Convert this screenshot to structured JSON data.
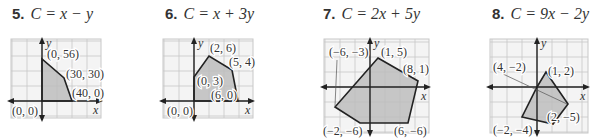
{
  "problems": [
    {
      "number": "5.",
      "objective": "C = x − y",
      "title_x": 12,
      "grid": {
        "x": 11,
        "y": 39,
        "w": 90,
        "h": 79,
        "cell": 15
      },
      "origin_px": [
        42,
        101
      ],
      "axis_labels": {
        "x": "x",
        "y": "y"
      },
      "vertices": [
        {
          "label": "(0, 0)",
          "coord": [
            0,
            0
          ],
          "px": [
            42,
            101
          ],
          "label_px": [
            12,
            115
          ]
        },
        {
          "label": "(0, 56)",
          "coord": [
            0,
            56
          ],
          "px": [
            42,
            59
          ],
          "label_px": [
            47,
            58
          ]
        },
        {
          "label": "(30, 30)",
          "coord": [
            30,
            30
          ],
          "px": [
            64,
            78
          ],
          "label_px": [
            66,
            78
          ]
        },
        {
          "label": "(40, 0)",
          "coord": [
            40,
            0
          ],
          "px": [
            72,
            101
          ],
          "label_px": [
            72,
            97
          ]
        }
      ]
    },
    {
      "number": "6.",
      "objective": "C = x + 3y",
      "title_x": 165,
      "grid": {
        "x": 163,
        "y": 39,
        "w": 90,
        "h": 79,
        "cell": 15
      },
      "origin_px": [
        194,
        101
      ],
      "axis_labels": {
        "x": "x",
        "y": "y"
      },
      "vertices": [
        {
          "label": "(0, 0)",
          "coord": [
            0,
            0
          ],
          "px": [
            194,
            101
          ],
          "label_px": [
            167,
            115
          ]
        },
        {
          "label": "(0, 3)",
          "coord": [
            0,
            3
          ],
          "px": [
            194,
            77
          ],
          "label_px": [
            197,
            85
          ]
        },
        {
          "label": "(2, 6)",
          "coord": [
            2,
            6
          ],
          "px": [
            209,
            56
          ],
          "label_px": [
            210,
            52
          ]
        },
        {
          "label": "(5, 4)",
          "coord": [
            5,
            4
          ],
          "px": [
            232,
            70
          ],
          "label_px": [
            229,
            66
          ]
        },
        {
          "label": "(6, 0)",
          "coord": [
            6,
            0
          ],
          "px": [
            238,
            101
          ],
          "label_px": [
            211,
            99
          ]
        }
      ]
    },
    {
      "number": "7.",
      "objective": "C = 2x + 5y",
      "title_x": 323,
      "grid": {
        "x": 324,
        "y": 39,
        "w": 105,
        "h": 94,
        "cell": 15
      },
      "origin_px": [
        370,
        87
      ],
      "axis_labels": {
        "x": "x",
        "y": "y"
      },
      "vertices": [
        {
          "label": "(1, 5)",
          "coord": [
            1,
            5
          ],
          "px": [
            378,
            58
          ],
          "label_px": [
            381,
            56
          ]
        },
        {
          "label": "(8, 1)",
          "coord": [
            8,
            1
          ],
          "px": [
            418,
            81
          ],
          "label_px": [
            403,
            73
          ]
        },
        {
          "label": "(6, −6)",
          "coord": [
            6,
            -6
          ],
          "px": [
            408,
            123
          ],
          "label_px": [
            394,
            135
          ]
        },
        {
          "label": "(−2, −6)",
          "coord": [
            -2,
            -6
          ],
          "px": [
            360,
            123
          ],
          "label_px": [
            323,
            135
          ]
        },
        {
          "label": "(−6, −3)",
          "coord": [
            -6,
            -3
          ],
          "px": [
            335,
            107
          ],
          "label_px": [
            329,
            56
          ]
        }
      ],
      "leader": {
        "from": [
          337,
          60
        ],
        "to": [
          335,
          106
        ]
      }
    },
    {
      "number": "8.",
      "objective": "C = 9x − 2y",
      "title_x": 492,
      "grid": {
        "x": 490,
        "y": 39,
        "w": 98,
        "h": 94,
        "cell": 15
      },
      "origin_px": [
        537,
        87
      ],
      "axis_labels": {
        "x": "x",
        "y": "y"
      },
      "vertices": [
        {
          "label": "(0, 0)",
          "coord": [
            0,
            0
          ],
          "px": [
            537,
            87
          ],
          "label_px": null
        },
        {
          "label": "(1, 2)",
          "coord": [
            1,
            2
          ],
          "px": [
            546,
            72
          ],
          "label_px": [
            548,
            75
          ]
        },
        {
          "label": "(4, −2)",
          "coord": [
            4,
            -2
          ],
          "px": [
            568,
            104
          ],
          "label_px": [
            493,
            71
          ]
        },
        {
          "label": "(2, −5)",
          "coord": [
            2,
            -5
          ],
          "px": [
            553,
            124
          ],
          "label_px": [
            547,
            121
          ]
        },
        {
          "label": "(−2, −4)",
          "coord": [
            -2,
            -4
          ],
          "px": [
            522,
            117
          ],
          "label_px": [
            493,
            134
          ]
        }
      ],
      "leader": {
        "from": [
          503,
          74
        ],
        "to": [
          567,
          104
        ]
      }
    }
  ],
  "colors": {
    "grid": "#c8c8c8",
    "grid_bg": "#f4f4f4",
    "fill": "#bdbdbd",
    "edge": "#222222",
    "axis": "#222222",
    "text": "#333333"
  }
}
